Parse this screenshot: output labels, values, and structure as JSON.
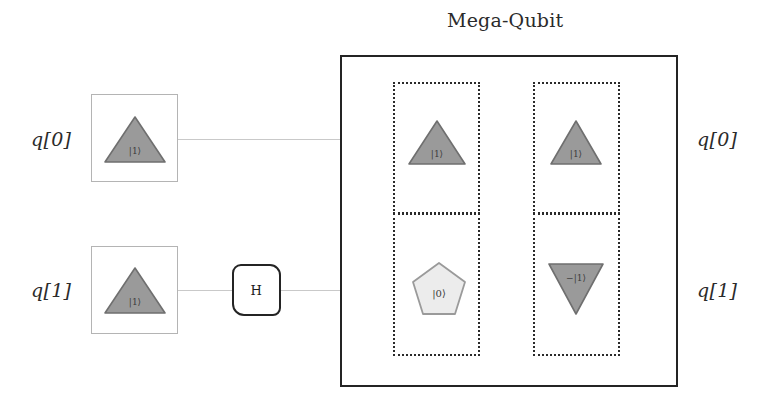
{
  "diagram": {
    "title": "Mega-Qubit",
    "kind": "quantum-circuit",
    "wire_color": "#c9c9c9",
    "shape_fill_filled": "#9a9a9a",
    "shape_fill_empty": "#ececec",
    "shape_stroke": "#6f6f6f",
    "frame_color": "#242424"
  },
  "left_labels": [
    {
      "text": "q[0]"
    },
    {
      "text": "q[1]"
    }
  ],
  "right_labels": [
    {
      "text": "q[0]"
    },
    {
      "text": "q[1]"
    }
  ],
  "input_boxes": [
    {
      "state": "|1⟩",
      "shape": "triangle-up",
      "filled": true
    },
    {
      "state": "|1⟩",
      "shape": "triangle-up",
      "filled": true
    }
  ],
  "gates": [
    {
      "label": "H",
      "wire": "q[1]"
    }
  ],
  "mega_cells": [
    {
      "column": 0,
      "row": 0,
      "state": "|1⟩",
      "shape": "triangle-up",
      "filled": true
    },
    {
      "column": 1,
      "row": 0,
      "state": "|1⟩",
      "shape": "triangle-up",
      "filled": true
    },
    {
      "column": 0,
      "row": 1,
      "state": "|0⟩",
      "shape": "pentagon",
      "filled": false
    },
    {
      "column": 1,
      "row": 1,
      "state": "−|1⟩",
      "shape": "triangle-down",
      "filled": true
    }
  ]
}
